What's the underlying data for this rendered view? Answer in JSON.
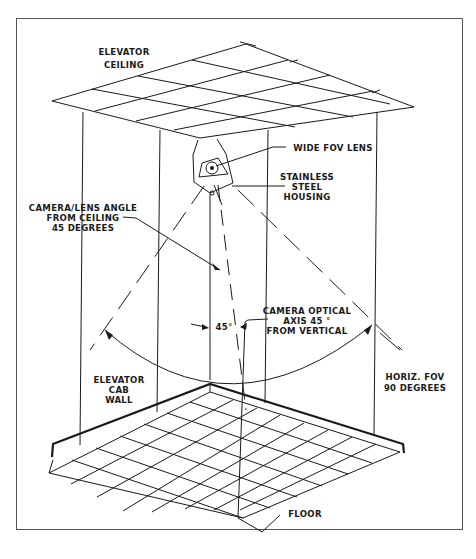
{
  "diagram": {
    "labels": {
      "ceiling": [
        "ELEVATOR",
        "CEILING"
      ],
      "lens": "WIDE FOV LENS",
      "housing": [
        "STAINLESS",
        "STEEL",
        "HOUSING"
      ],
      "camera_angle": [
        "CAMERA/LENS ANGLE",
        "FROM CEILING",
        "45 DEGREES"
      ],
      "optical_axis": [
        "CAMERA OPTICAL",
        "AXIS 45 °",
        "FROM VERTICAL"
      ],
      "angle_mark": "45°",
      "wall": [
        "ELEVATOR",
        "CAB",
        "WALL"
      ],
      "fov": [
        "HORIZ. FOV",
        "90 DEGREES"
      ],
      "floor": "FLOOR"
    },
    "colors": {
      "line": "#1a1a1a",
      "frame": "#555555",
      "background": "#ffffff"
    }
  }
}
